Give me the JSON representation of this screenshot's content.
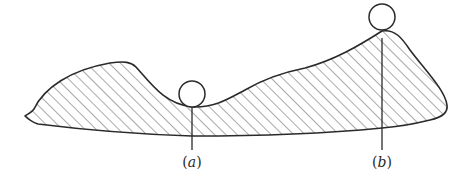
{
  "figure": {
    "colors": {
      "stroke": "#2a2a2a",
      "hatch": "#555555",
      "background": "#ffffff"
    },
    "balls": [
      {
        "id": "a",
        "cx": 192,
        "cy": 94,
        "r": 13
      },
      {
        "id": "b",
        "cx": 382,
        "cy": 17,
        "r": 13
      }
    ],
    "labels": {
      "a": {
        "open": "(",
        "var": "a",
        "close": ")"
      },
      "b": {
        "open": "(",
        "var": "b",
        "close": ")"
      }
    }
  }
}
